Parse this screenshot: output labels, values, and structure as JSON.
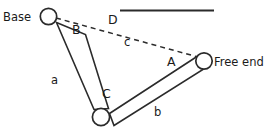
{
  "figure": {
    "type": "kinematic-chain-diagram",
    "background_color": "#ffffff",
    "line_color": "#2b2b2b",
    "text_color": "#1a1a1a"
  },
  "labels": {
    "base": "Base",
    "free_end": "Free end",
    "link_a": "a",
    "link_b": "b",
    "segment_c": "c",
    "angle_A": "A",
    "angle_B": "B",
    "angle_C": "C",
    "angle_D": "D"
  },
  "joints": [
    {
      "name": "base-joint",
      "cx": 48.5,
      "cy": 16.5,
      "r": 8.2
    },
    {
      "name": "middle-joint",
      "cx": 101.0,
      "cy": 117.0,
      "r": 8.6
    },
    {
      "name": "free-end-joint",
      "cx": 204.0,
      "cy": 61.0,
      "r": 8.2
    }
  ],
  "links": [
    {
      "name": "link-a",
      "label": "a",
      "points": "56.5,22.5 85.5,34.5 108.5,108.5 94.0,109.5"
    },
    {
      "name": "link-b",
      "label": "b",
      "points": "109.5,113.5 197.0,56.5 203.0,69.5 114.0,125.5"
    }
  ],
  "reference_line": {
    "name": "horizontal-reference-line",
    "x1": 120.0,
    "y1": 10.5,
    "x2": 214.0,
    "y2": 10.5
  },
  "chord_line": {
    "name": "chord-c-dashed",
    "x1": 56.0,
    "y1": 18.0,
    "x2": 198.0,
    "y2": 57.0,
    "style": "dashed"
  },
  "label_positions": {
    "base": {
      "x": 3,
      "y": 21
    },
    "free_end": {
      "x": 214,
      "y": 66
    },
    "angle_D": {
      "x": 108,
      "y": 24
    },
    "angle_B": {
      "x": 72,
      "y": 34
    },
    "segment_c": {
      "x": 124,
      "y": 46
    },
    "angle_A": {
      "x": 167,
      "y": 66
    },
    "link_a": {
      "x": 51,
      "y": 84
    },
    "angle_C": {
      "x": 102,
      "y": 98
    },
    "link_b": {
      "x": 154,
      "y": 116
    }
  },
  "chart_data": {
    "type": "diagram",
    "nodes": [
      {
        "id": "base",
        "label": "Base",
        "x": 48.5,
        "y": 16.5
      },
      {
        "id": "joint",
        "label": "",
        "x": 101.0,
        "y": 117.0
      },
      {
        "id": "free_end",
        "label": "Free end",
        "x": 204.0,
        "y": 61.0
      }
    ],
    "edges": [
      {
        "from": "base",
        "to": "joint",
        "label": "a",
        "style": "solid-bar"
      },
      {
        "from": "joint",
        "to": "free_end",
        "label": "b",
        "style": "solid-bar"
      },
      {
        "from": "base",
        "to": "free_end",
        "label": "c",
        "style": "dashed"
      }
    ],
    "angles": [
      {
        "label": "D",
        "at": "base",
        "between": [
          "horizontal-reference",
          "c"
        ]
      },
      {
        "label": "B",
        "at": "base",
        "between": [
          "a",
          "c"
        ]
      },
      {
        "label": "C",
        "at": "joint",
        "between": [
          "a",
          "b"
        ]
      },
      {
        "label": "A",
        "at": "free_end",
        "between": [
          "c",
          "b"
        ]
      }
    ]
  }
}
